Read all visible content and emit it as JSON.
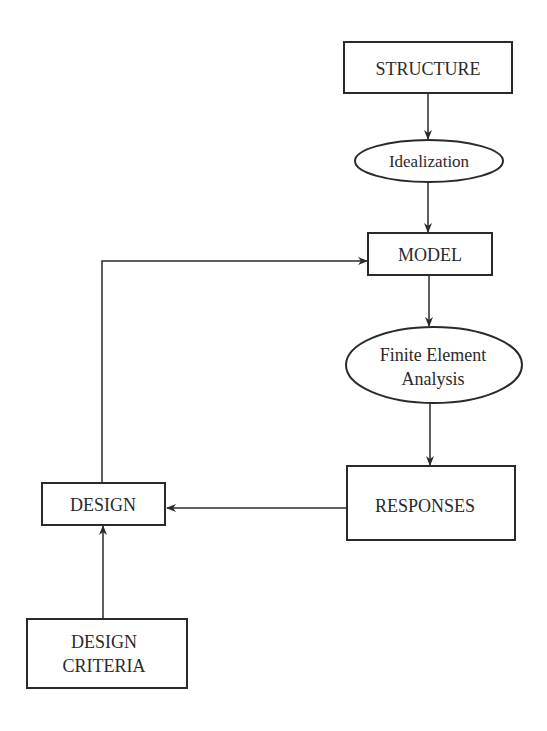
{
  "diagram": {
    "colors": {
      "stroke": "#2a2a2a",
      "background": "#ffffff"
    },
    "nodes": {
      "structure": {
        "label": "STRUCTURE",
        "shape": "rectangle"
      },
      "idealization": {
        "label": "Idealization",
        "shape": "ellipse"
      },
      "model": {
        "label": "MODEL",
        "shape": "rectangle"
      },
      "fea": {
        "line1": "Finite Element",
        "line2": "Analysis",
        "shape": "ellipse"
      },
      "responses": {
        "label": "RESPONSES",
        "shape": "rectangle"
      },
      "design": {
        "label": "DESIGN",
        "shape": "rectangle"
      },
      "design_criteria": {
        "line1": "DESIGN",
        "line2": "CRITERIA",
        "shape": "rectangle"
      }
    },
    "edges": [
      {
        "from": "STRUCTURE",
        "to": "Idealization"
      },
      {
        "from": "Idealization",
        "to": "MODEL"
      },
      {
        "from": "MODEL",
        "to": "Finite Element Analysis"
      },
      {
        "from": "Finite Element Analysis",
        "to": "RESPONSES"
      },
      {
        "from": "RESPONSES",
        "to": "DESIGN"
      },
      {
        "from": "DESIGN CRITERIA",
        "to": "DESIGN"
      },
      {
        "from": "DESIGN",
        "to": "MODEL"
      }
    ]
  }
}
